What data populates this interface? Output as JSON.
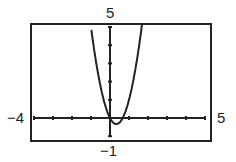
{
  "chart_data": {
    "type": "line",
    "title": "",
    "xlabel": "",
    "ylabel": "",
    "xlim": [
      -4,
      5
    ],
    "ylim": [
      -1,
      5
    ],
    "tick_labels": {
      "xmin": "−4",
      "xmax": "5",
      "ymin": "−1",
      "ymax": "5"
    },
    "x_ticks": [
      -4,
      -3,
      -2,
      -1,
      0,
      1,
      2,
      3,
      4,
      5
    ],
    "y_ticks": [
      -1,
      0,
      1,
      2,
      3,
      4,
      5
    ],
    "grid": false,
    "series": [
      {
        "name": "y = 3x^2 - 2x (approx.)",
        "x": [
          -0.95,
          -0.5,
          0,
          0.33,
          0.67,
          1,
          1.5,
          1.68
        ],
        "y": [
          4.6,
          1.75,
          0,
          -0.33,
          0,
          1,
          3.75,
          5.1
        ]
      }
    ]
  },
  "labels": {
    "xmin": "−4",
    "xmax": "5",
    "ymin": "−1",
    "ymax": "5"
  }
}
